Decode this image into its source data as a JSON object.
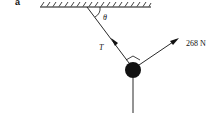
{
  "diagram": {
    "part_label": "a",
    "angle_label": "θ",
    "tension_label": "T",
    "force_label": "268 N",
    "colors": {
      "ink": "#111111",
      "background": "#ffffff"
    }
  }
}
